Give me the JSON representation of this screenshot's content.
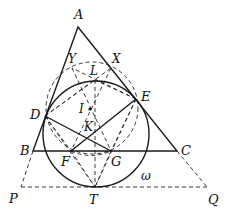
{
  "diagram": {
    "points": {
      "A": {
        "label": "A",
        "x": 78,
        "y": 27
      },
      "B": {
        "label": "B",
        "x": 33,
        "y": 151
      },
      "C": {
        "label": "C",
        "x": 177,
        "y": 151
      },
      "D": {
        "label": "D",
        "x": 45,
        "y": 116
      },
      "E": {
        "label": "E",
        "x": 136,
        "y": 99
      },
      "F": {
        "label": "F",
        "x": 71,
        "y": 151
      },
      "G": {
        "label": "G",
        "x": 111,
        "y": 151
      },
      "I": {
        "label": "I",
        "x": 90,
        "y": 109
      },
      "K": {
        "label": "K",
        "x": 89,
        "y": 126
      },
      "L": {
        "label": "L",
        "x": 95,
        "y": 80
      },
      "X": {
        "label": "X",
        "x": 111,
        "y": 68
      },
      "Y": {
        "label": "Y",
        "x": 72,
        "y": 68
      },
      "P": {
        "label": "P",
        "x": 21,
        "y": 187
      },
      "Q": {
        "label": "Q",
        "x": 207,
        "y": 187
      },
      "T": {
        "label": "T",
        "x": 95,
        "y": 187
      }
    },
    "circle_label": "ω",
    "solid_circle": {
      "cx": 96,
      "cy": 134,
      "r": 53
    },
    "dashed_circle": {
      "cx": 92,
      "cy": 108,
      "r": 46
    },
    "stroke_color": "#1a1a1a"
  }
}
